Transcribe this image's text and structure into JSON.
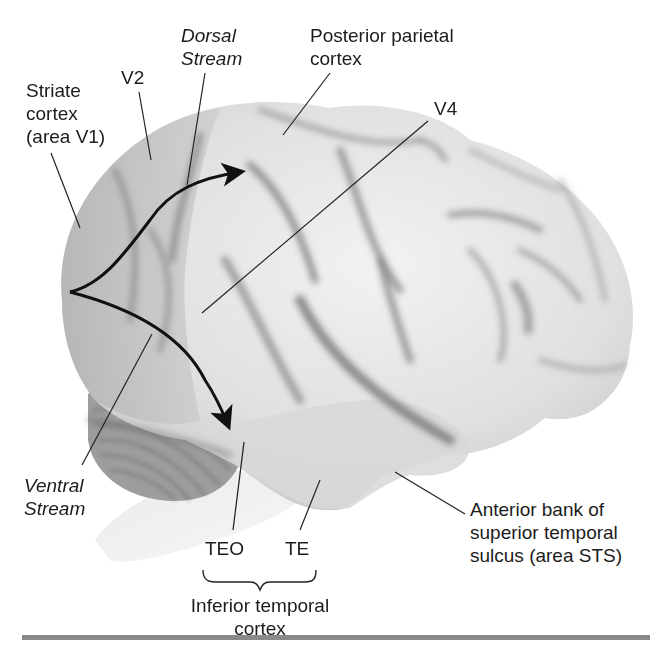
{
  "figure": {
    "labels": {
      "striate": [
        "Striate",
        "cortex",
        "(area V1)"
      ],
      "v2": "V2",
      "dorsal_stream": [
        "Dorsal",
        "Stream"
      ],
      "posterior_parietal": [
        "Posterior parietal",
        "cortex"
      ],
      "v4": "V4",
      "ventral_stream": [
        "Ventral",
        "Stream"
      ],
      "teo": "TEO",
      "te": "TE",
      "inferior_temporal": [
        "Inferior temporal",
        "cortex"
      ],
      "sts": [
        "Anterior bank of",
        "superior temporal",
        "sulcus (area STS)"
      ]
    },
    "colors": {
      "background": "#ffffff",
      "cortex_light": "#e6e6e6",
      "cortex_mid": "#bdbdbd",
      "sulcus": "#6e6e6e",
      "arrow": "#111111",
      "rule": "#8a8a8a"
    }
  }
}
